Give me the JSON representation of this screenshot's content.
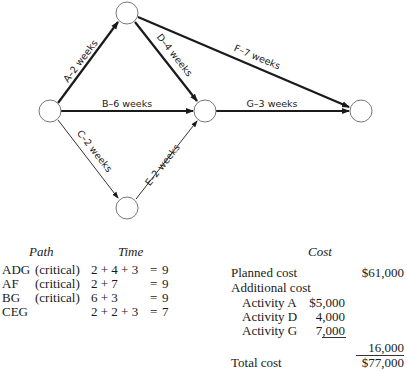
{
  "network": {
    "nodes": [
      {
        "id": "n_top",
        "cx": 127,
        "cy": 13
      },
      {
        "id": "n_left",
        "cx": 50,
        "cy": 111
      },
      {
        "id": "n_mid",
        "cx": 205,
        "cy": 111
      },
      {
        "id": "n_right",
        "cx": 361,
        "cy": 111
      },
      {
        "id": "n_bottom",
        "cx": 127,
        "cy": 208
      }
    ],
    "edges": [
      {
        "activity": "A",
        "label": "A–2 weeks",
        "from": "n_left",
        "to": "n_top",
        "weight": "heavy"
      },
      {
        "activity": "B",
        "label": "B–6 weeks",
        "from": "n_left",
        "to": "n_mid",
        "weight": "heavy"
      },
      {
        "activity": "C",
        "label": "C–2 weeks",
        "from": "n_left",
        "to": "n_bottom",
        "weight": "light"
      },
      {
        "activity": "D",
        "label": "D–4 weeks",
        "from": "n_top",
        "to": "n_mid",
        "weight": "heavy"
      },
      {
        "activity": "E",
        "label": "E–2 weeks",
        "from": "n_bottom",
        "to": "n_mid",
        "weight": "light"
      },
      {
        "activity": "F",
        "label": "F–7 weeks",
        "from": "n_top",
        "to": "n_right",
        "weight": "heavy"
      },
      {
        "activity": "G",
        "label": "G–3 weeks",
        "from": "n_mid",
        "to": "n_right",
        "weight": "heavy"
      }
    ]
  },
  "paths_table": {
    "header_path": "Path",
    "header_time": "Time",
    "rows": [
      {
        "path": "ADG",
        "note": "(critical)",
        "expr": "2 + 4 + 3",
        "eq": "=",
        "total": "9"
      },
      {
        "path": "AF",
        "note": "(critical)",
        "expr": "2 + 7",
        "eq": "=",
        "total": "9"
      },
      {
        "path": "BG",
        "note": "(critical)",
        "expr": "6 + 3",
        "eq": "=",
        "total": "9"
      },
      {
        "path": "CEG",
        "note": "",
        "expr": "2 + 2 + 3",
        "eq": "=",
        "total": "7"
      }
    ]
  },
  "cost_table": {
    "header": "Cost",
    "planned_label": "Planned cost",
    "planned_value": "$61,000",
    "additional_label": "Additional cost",
    "activities": [
      {
        "label": "Activity A",
        "value": "$5,000"
      },
      {
        "label": "Activity D",
        "value": "4,000"
      },
      {
        "label": "Activity G",
        "value": "7,000"
      }
    ],
    "additional_total": "16,000",
    "total_label": "Total cost",
    "total_value": "$77,000"
  }
}
